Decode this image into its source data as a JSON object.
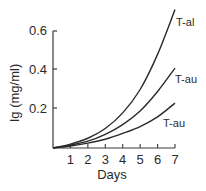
{
  "chart_data": {
    "type": "line",
    "title": "",
    "xlabel": "Days",
    "ylabel": "Ig (mg/ml)",
    "x_ticks": [
      "1",
      "2",
      "3",
      "4",
      "5",
      "6",
      "7"
    ],
    "y_ticks": [
      "0.2",
      "0.4",
      "0.6"
    ],
    "xlim": [
      0,
      7
    ],
    "ylim": [
      0,
      0.6
    ],
    "grid": false,
    "legend": "inline labels at curve ends",
    "x": [
      0,
      1,
      2,
      3,
      4,
      5,
      6,
      7
    ],
    "series": [
      {
        "name": "T-al",
        "values": [
          0.0,
          0.02,
          0.05,
          0.1,
          0.18,
          0.3,
          0.48,
          0.71
        ]
      },
      {
        "name": "T-au",
        "values": [
          0.0,
          0.015,
          0.035,
          0.07,
          0.12,
          0.19,
          0.29,
          0.41
        ]
      },
      {
        "name": "T-au",
        "values": [
          0.0,
          0.01,
          0.025,
          0.045,
          0.075,
          0.11,
          0.16,
          0.23
        ]
      }
    ]
  },
  "labels": {
    "ylabel": "Ig (mg/ml)",
    "xlabel": "Days",
    "series_1": "T-al",
    "series_2": "T-au",
    "series_3": "T-au"
  }
}
